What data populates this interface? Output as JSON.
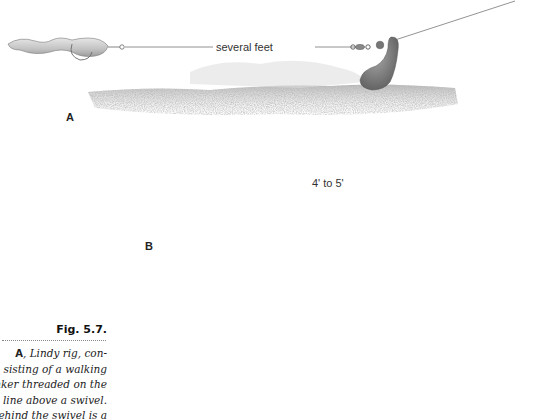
{
  "figure": {
    "number_label": "Fig. 5.7.",
    "caption_lines": [
      {
        "lead": "A",
        "text": ", Lindy rig, con-"
      },
      {
        "text": "sisting of a walking"
      },
      {
        "text": "sinker threaded on the"
      },
      {
        "text": "line above a swivel."
      },
      {
        "text": "Behind the swivel is a"
      }
    ]
  },
  "panels": [
    {
      "id": "A",
      "label": "A",
      "distance_label": "several feet",
      "description": "Lindy rig with plastic worm, swivel and walking sinker on bottom"
    },
    {
      "id": "B",
      "label": "B",
      "distance_label": "4' to 5'",
      "description": "Three-way rig with minnow plug and dropper line to bell sinker"
    }
  ],
  "colors": {
    "line": "#777777",
    "lure_body": "#cfcfcf",
    "sinker": "#8a8a8a",
    "bottom": "#b5b5b5",
    "text": "#222222"
  }
}
